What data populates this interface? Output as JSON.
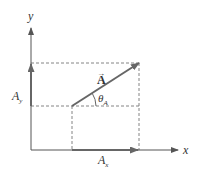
{
  "diagram": {
    "axes": {
      "x_label": "x",
      "y_label": "y"
    },
    "vector": {
      "label": "A",
      "arrow_over": "→"
    },
    "angle": {
      "symbol": "θ",
      "subscript": "A"
    },
    "components": {
      "x": {
        "base": "A",
        "subscript": "x"
      },
      "y": {
        "base": "A",
        "subscript": "y"
      }
    },
    "colors": {
      "axis": "#555555",
      "vector": "#666666",
      "dashed": "#777777",
      "text": "#333333",
      "background": "#ffffff"
    }
  }
}
